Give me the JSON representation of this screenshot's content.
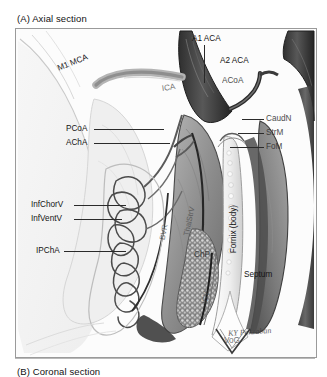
{
  "figure": {
    "panel_a_caption": "(A) Axial section",
    "panel_b_caption": "(B) Coronal section",
    "artist_signature": "KY Pakzaban",
    "style": {
      "background": "#ffffff",
      "frame_border": "#9a9a9a",
      "ink": "#141414",
      "artery_dark": "#3a3a3a",
      "artery_mid": "#6e6e6e",
      "tissue_light": "#cfcfcf",
      "tissue_mid": "#9b9b9b",
      "choroid_plexus": "#7d7d7d",
      "vein_line": "#2b2b2b"
    }
  },
  "labels": {
    "left_column": [
      {
        "id": "pcoa",
        "text": "PCoA",
        "full": "Posterior communicating artery"
      },
      {
        "id": "acha",
        "text": "AChA",
        "full": "Anterior choroidal artery"
      },
      {
        "id": "infchorv",
        "text": "InfChorV",
        "full": "Inferior choroidal vein"
      },
      {
        "id": "infventv",
        "text": "InfVentV",
        "full": "Inferior ventricular vein"
      },
      {
        "id": "ipcha",
        "text": "IPChA",
        "full": "Inferior posterior choroidal artery"
      }
    ],
    "right_column": [
      {
        "id": "caudn",
        "text": "CaudN",
        "full": "Caudate nucleus"
      },
      {
        "id": "strm",
        "text": "StrM",
        "full": "Stria medullaris"
      },
      {
        "id": "fom",
        "text": "FoM",
        "full": "Foramen of Monro"
      }
    ],
    "top": [
      {
        "id": "a1aca",
        "text": "A1 ACA",
        "full": "A1 segment anterior cerebral artery"
      },
      {
        "id": "a2aca",
        "text": "A2 ACA",
        "full": "A2 segment anterior cerebral artery"
      },
      {
        "id": "acoa",
        "text": "ACoA",
        "full": "Anterior communicating artery"
      },
      {
        "id": "m1mca",
        "text": "M1 MCA",
        "full": "M1 segment middle cerebral artery"
      },
      {
        "id": "ica",
        "text": "ICA",
        "full": "Internal carotid artery"
      }
    ],
    "inline": [
      {
        "id": "bvr",
        "text": "BVR",
        "full": "Basal vein of Rosenthal"
      },
      {
        "id": "thalstr",
        "text": "ThalStrV",
        "full": "Thalamostriate vein"
      },
      {
        "id": "fornix",
        "text": "Fornix (body)",
        "full": "Body of the fornix"
      },
      {
        "id": "chp",
        "text": "ChP",
        "full": "Choroid plexus"
      },
      {
        "id": "icv",
        "text": "ICV",
        "full": "Internal cerebral vein"
      },
      {
        "id": "septum",
        "text": "Septum",
        "full": "Septum pellucidum"
      },
      {
        "id": "vog",
        "text": "VoG",
        "full": "Vein of Galen"
      }
    ]
  }
}
